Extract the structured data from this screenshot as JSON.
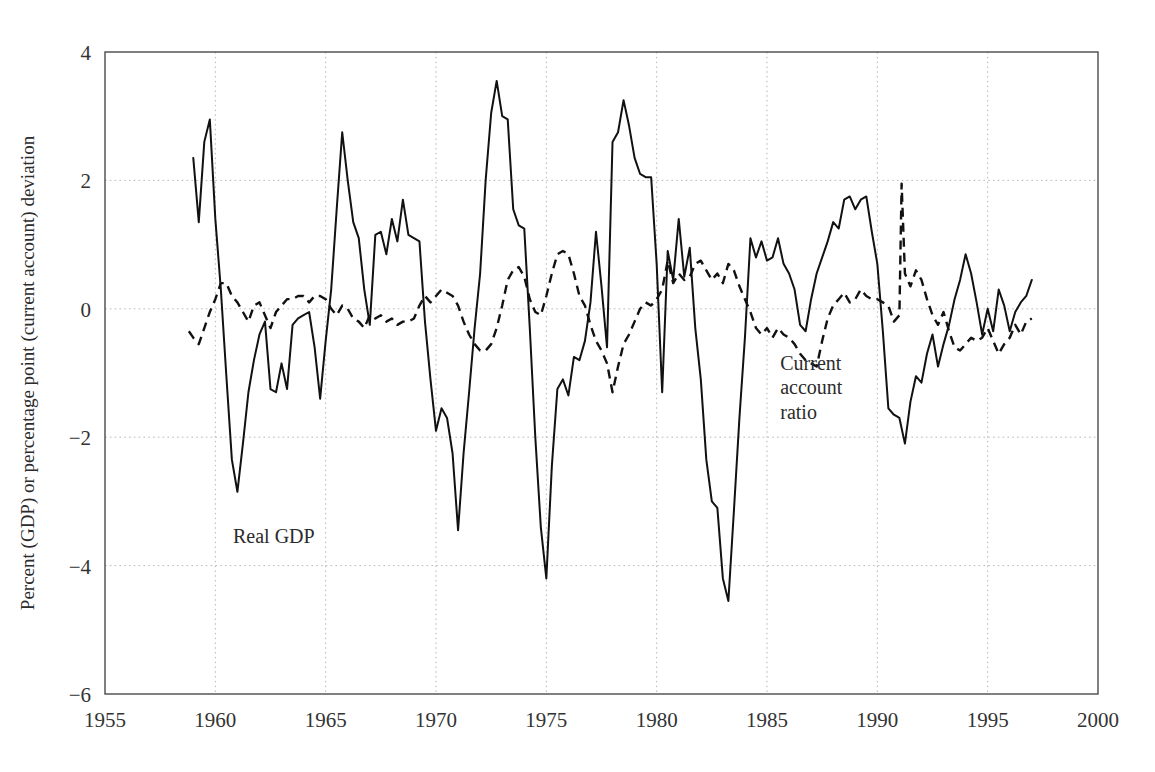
{
  "chart_data": {
    "type": "line",
    "title": "",
    "xlabel": "",
    "ylabel": "Percent (GDP) or percentage point (current account) deviation",
    "xlim": [
      1955,
      2000
    ],
    "ylim": [
      -6,
      4
    ],
    "xticks": [
      "1955",
      "1960",
      "1965",
      "1970",
      "1975",
      "1980",
      "1985",
      "1990",
      "1995",
      "2000"
    ],
    "yticks": [
      "4",
      "2",
      "0",
      "-2",
      "-4",
      "-6"
    ],
    "grid": true,
    "legend_position": "inline-annotation",
    "annotations": [
      {
        "text": "Real GDP",
        "x": 1960.8,
        "y": -3.65,
        "series": "real_gdp"
      },
      {
        "text": "Current",
        "x": 1985.6,
        "y": -0.95,
        "series": "current_account_ratio"
      },
      {
        "text": "account",
        "x": 1985.6,
        "y": -1.33,
        "series": "current_account_ratio"
      },
      {
        "text": "ratio",
        "x": 1985.6,
        "y": -1.71,
        "series": "current_account_ratio"
      }
    ],
    "series": [
      {
        "name": "Real GDP",
        "style": "solid",
        "color": "#111111",
        "x": [
          1959.0,
          1959.25,
          1959.5,
          1959.75,
          1960.0,
          1960.25,
          1960.5,
          1960.75,
          1961.0,
          1961.25,
          1961.5,
          1961.75,
          1962.0,
          1962.25,
          1962.5,
          1962.75,
          1963.0,
          1963.25,
          1963.5,
          1963.75,
          1964.0,
          1964.25,
          1964.5,
          1964.75,
          1965.0,
          1965.25,
          1965.5,
          1965.75,
          1966.0,
          1966.25,
          1966.5,
          1966.75,
          1967.0,
          1967.25,
          1967.5,
          1967.75,
          1968.0,
          1968.25,
          1968.5,
          1968.75,
          1969.0,
          1969.25,
          1969.5,
          1969.75,
          1970.0,
          1970.25,
          1970.5,
          1970.75,
          1971.0,
          1971.25,
          1971.5,
          1971.75,
          1972.0,
          1972.25,
          1972.5,
          1972.75,
          1973.0,
          1973.25,
          1973.5,
          1973.75,
          1974.0,
          1974.25,
          1974.5,
          1974.75,
          1975.0,
          1975.25,
          1975.5,
          1975.75,
          1976.0,
          1976.25,
          1976.5,
          1976.75,
          1977.0,
          1977.25,
          1977.5,
          1977.75,
          1978.0,
          1978.25,
          1978.5,
          1978.75,
          1979.0,
          1979.25,
          1979.5,
          1979.75,
          1980.0,
          1980.25,
          1980.5,
          1980.75,
          1981.0,
          1981.25,
          1981.5,
          1981.75,
          1982.0,
          1982.25,
          1982.5,
          1982.75,
          1983.0,
          1983.25,
          1983.5,
          1983.75,
          1984.0,
          1984.25,
          1984.5,
          1984.75,
          1985.0,
          1985.25,
          1985.5,
          1985.75,
          1986.0,
          1986.25,
          1986.5,
          1986.75,
          1987.0,
          1987.25,
          1987.5,
          1987.75,
          1988.0,
          1988.25,
          1988.5,
          1988.75,
          1989.0,
          1989.25,
          1989.5,
          1989.75,
          1990.0,
          1990.25,
          1990.5,
          1990.75,
          1991.0,
          1991.25,
          1991.5,
          1991.75,
          1992.0,
          1992.25,
          1992.5,
          1992.75,
          1993.0,
          1993.25,
          1993.5,
          1993.75,
          1994.0,
          1994.25,
          1994.5,
          1994.75,
          1995.0,
          1995.25,
          1995.5,
          1995.75,
          1996.0,
          1996.25,
          1996.5,
          1996.75,
          1997.0
        ],
        "y": [
          2.35,
          1.35,
          2.6,
          2.95,
          1.4,
          0.3,
          -1.05,
          -2.35,
          -2.85,
          -2.1,
          -1.3,
          -0.8,
          -0.4,
          -0.2,
          -1.25,
          -1.3,
          -0.85,
          -1.25,
          -0.25,
          -0.15,
          -0.1,
          -0.05,
          -0.6,
          -1.4,
          -0.5,
          0.3,
          1.55,
          2.75,
          2.0,
          1.35,
          1.1,
          0.3,
          -0.25,
          1.15,
          1.2,
          0.85,
          1.4,
          1.05,
          1.7,
          1.15,
          1.1,
          1.05,
          -0.2,
          -1.1,
          -1.9,
          -1.55,
          -1.7,
          -2.25,
          -3.45,
          -2.25,
          -1.3,
          -0.3,
          0.55,
          2.0,
          3.05,
          3.55,
          3.0,
          2.95,
          1.55,
          1.3,
          1.25,
          -0.3,
          -2.0,
          -3.4,
          -4.2,
          -2.45,
          -1.25,
          -1.1,
          -1.35,
          -0.75,
          -0.8,
          -0.5,
          0.1,
          1.2,
          0.35,
          -0.6,
          2.6,
          2.75,
          3.25,
          2.85,
          2.35,
          2.1,
          2.05,
          2.05,
          0.7,
          -1.3,
          0.9,
          0.45,
          1.4,
          0.5,
          0.95,
          -0.3,
          -1.1,
          -2.35,
          -3.0,
          -3.1,
          -4.2,
          -4.55,
          -3.15,
          -1.7,
          -0.45,
          1.1,
          0.8,
          1.05,
          0.75,
          0.8,
          1.1,
          0.7,
          0.55,
          0.3,
          -0.25,
          -0.35,
          0.15,
          0.55,
          0.8,
          1.05,
          1.35,
          1.25,
          1.7,
          1.75,
          1.55,
          1.7,
          1.75,
          1.2,
          0.7,
          -0.35,
          -1.55,
          -1.65,
          -1.7,
          -2.1,
          -1.45,
          -1.05,
          -1.15,
          -0.7,
          -0.4,
          -0.9,
          -0.55,
          -0.25,
          0.15,
          0.45,
          0.85,
          0.55,
          0.1,
          -0.4,
          0.0,
          -0.35,
          0.3,
          0.05,
          -0.35,
          -0.05,
          0.1,
          0.2,
          0.45
        ]
      },
      {
        "name": "Current account ratio",
        "style": "dashed",
        "color": "#111111",
        "x": [
          1958.8,
          1959.0,
          1959.25,
          1959.5,
          1959.75,
          1960.0,
          1960.25,
          1960.5,
          1960.75,
          1961.0,
          1961.25,
          1961.5,
          1961.75,
          1962.0,
          1962.25,
          1962.5,
          1962.75,
          1963.0,
          1963.25,
          1963.5,
          1963.75,
          1964.0,
          1964.25,
          1964.5,
          1964.75,
          1965.0,
          1965.25,
          1965.5,
          1965.75,
          1966.0,
          1966.25,
          1966.5,
          1966.75,
          1967.0,
          1967.25,
          1967.5,
          1967.75,
          1968.0,
          1968.25,
          1968.5,
          1968.75,
          1969.0,
          1969.25,
          1969.5,
          1969.75,
          1970.0,
          1970.25,
          1970.5,
          1970.75,
          1971.0,
          1971.25,
          1971.5,
          1971.75,
          1972.0,
          1972.25,
          1972.5,
          1972.75,
          1973.0,
          1973.25,
          1973.5,
          1973.75,
          1974.0,
          1974.25,
          1974.5,
          1974.75,
          1975.0,
          1975.25,
          1975.5,
          1975.75,
          1976.0,
          1976.25,
          1976.5,
          1976.75,
          1977.0,
          1977.25,
          1977.5,
          1977.75,
          1978.0,
          1978.25,
          1978.5,
          1978.75,
          1979.0,
          1979.25,
          1979.5,
          1979.75,
          1980.0,
          1980.25,
          1980.5,
          1980.75,
          1981.0,
          1981.25,
          1981.5,
          1981.75,
          1982.0,
          1982.25,
          1982.5,
          1982.75,
          1983.0,
          1983.25,
          1983.5,
          1983.75,
          1984.0,
          1984.25,
          1984.5,
          1984.75,
          1985.0,
          1985.25,
          1985.5,
          1985.75,
          1986.0,
          1986.25,
          1986.5,
          1986.75,
          1987.0,
          1987.25,
          1987.5,
          1987.75,
          1988.0,
          1988.25,
          1988.5,
          1988.75,
          1989.0,
          1989.25,
          1989.5,
          1989.75,
          1990.0,
          1990.25,
          1990.5,
          1990.75,
          1991.0,
          1991.1,
          1991.25,
          1991.5,
          1991.75,
          1992.0,
          1992.25,
          1992.5,
          1992.75,
          1993.0,
          1993.25,
          1993.5,
          1993.75,
          1994.0,
          1994.25,
          1994.5,
          1994.75,
          1995.0,
          1995.25,
          1995.5,
          1995.75,
          1996.0,
          1996.25,
          1996.5,
          1996.75,
          1997.0
        ],
        "y": [
          -0.35,
          -0.45,
          -0.55,
          -0.3,
          -0.05,
          0.15,
          0.4,
          0.4,
          0.2,
          0.1,
          -0.05,
          -0.2,
          0.05,
          0.1,
          -0.1,
          -0.3,
          -0.05,
          0.05,
          0.15,
          0.15,
          0.2,
          0.2,
          0.1,
          0.2,
          0.2,
          0.15,
          0.0,
          -0.1,
          0.05,
          0.0,
          -0.15,
          -0.2,
          -0.3,
          -0.1,
          -0.15,
          -0.1,
          -0.2,
          -0.15,
          -0.25,
          -0.2,
          -0.2,
          -0.15,
          0.05,
          0.2,
          0.1,
          0.2,
          0.3,
          0.25,
          0.2,
          0.05,
          -0.2,
          -0.4,
          -0.55,
          -0.65,
          -0.65,
          -0.55,
          -0.3,
          0.05,
          0.45,
          0.6,
          0.65,
          0.5,
          0.15,
          -0.05,
          -0.1,
          0.2,
          0.55,
          0.85,
          0.9,
          0.85,
          0.55,
          0.2,
          0.05,
          -0.25,
          -0.5,
          -0.65,
          -0.85,
          -1.3,
          -0.9,
          -0.55,
          -0.4,
          -0.2,
          0.0,
          0.1,
          0.05,
          0.15,
          0.3,
          0.75,
          0.4,
          0.55,
          0.45,
          0.5,
          0.7,
          0.75,
          0.6,
          0.45,
          0.55,
          0.4,
          0.7,
          0.6,
          0.35,
          0.15,
          -0.05,
          -0.3,
          -0.4,
          -0.3,
          -0.45,
          -0.3,
          -0.4,
          -0.45,
          -0.55,
          -0.7,
          -0.8,
          -0.85,
          -0.9,
          -0.5,
          -0.15,
          0.05,
          0.15,
          0.25,
          0.1,
          0.15,
          0.3,
          0.2,
          0.15,
          0.15,
          0.1,
          0.05,
          -0.2,
          -0.1,
          1.95,
          0.55,
          0.35,
          0.6,
          0.45,
          0.15,
          -0.1,
          -0.25,
          -0.05,
          -0.35,
          -0.6,
          -0.65,
          -0.55,
          -0.45,
          -0.5,
          -0.45,
          -0.3,
          -0.5,
          -0.7,
          -0.55,
          -0.45,
          -0.25,
          -0.4,
          -0.2,
          -0.15
        ]
      }
    ]
  },
  "plot_geometry": {
    "left": 105,
    "right": 1098,
    "top": 52,
    "bottom": 694
  }
}
